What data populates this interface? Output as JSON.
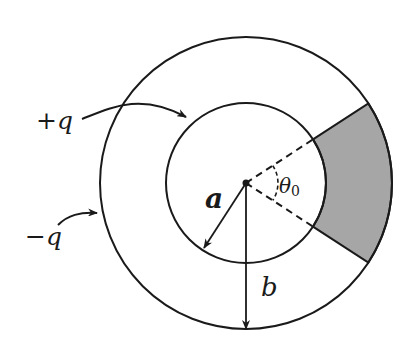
{
  "diagram": {
    "colors": {
      "stroke": "#1a1a1a",
      "sector_fill": "#a6a6a6",
      "background": "#ffffff"
    },
    "geometry": {
      "center": [
        246,
        183
      ],
      "inner_radius": 80,
      "outer_radius": 146,
      "sector_half_angle_deg": 33
    },
    "labels": {
      "plus_q": "+q",
      "minus_q": "−q",
      "a": "a",
      "b": "b",
      "theta": "θ",
      "theta_sub": "0"
    },
    "annotations": [
      {
        "label": "+q",
        "points_to": "inner sphere (radius a)"
      },
      {
        "label": "−q",
        "points_to": "outer sphere (radius b)"
      },
      {
        "label": "θ0",
        "describes": "half-angle... angular width of shaded sector between dashed radii"
      }
    ]
  }
}
